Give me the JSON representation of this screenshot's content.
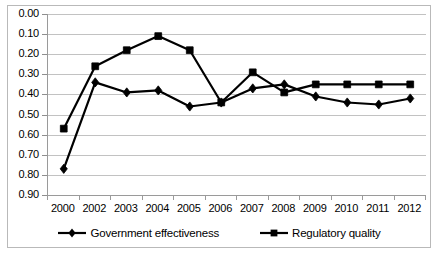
{
  "chart_data": {
    "type": "line",
    "title": "",
    "xlabel": "",
    "ylabel": "",
    "categories": [
      "2000",
      "2002",
      "2003",
      "2004",
      "2005",
      "2006",
      "2007",
      "2008",
      "2009",
      "2010",
      "2011",
      "2012"
    ],
    "ylim": [
      0.0,
      0.9
    ],
    "y_axis_inverted": true,
    "y_ticks": [
      "0.00",
      "0.10",
      "0.20",
      "0.30",
      "0.40",
      "0.50",
      "0.60",
      "0.70",
      "0.80",
      "0.90"
    ],
    "y_tick_values": [
      0.0,
      0.1,
      0.2,
      0.3,
      0.4,
      0.5,
      0.6,
      0.7,
      0.8,
      0.9
    ],
    "grid": true,
    "legend_position": "bottom",
    "series": [
      {
        "name": "Government effectiveness",
        "marker": "diamond",
        "color": "#000000",
        "values": [
          0.77,
          0.34,
          0.39,
          0.38,
          0.46,
          0.44,
          0.37,
          0.35,
          0.41,
          0.44,
          0.45,
          0.42
        ]
      },
      {
        "name": "Regulatory quality",
        "marker": "square",
        "color": "#000000",
        "values": [
          0.57,
          0.26,
          0.18,
          0.11,
          0.18,
          0.44,
          0.29,
          0.39,
          0.35,
          0.35,
          0.35,
          0.35
        ]
      }
    ]
  },
  "legend": {
    "items": [
      {
        "label": "Government effectiveness",
        "marker": "diamond"
      },
      {
        "label": "Regulatory quality",
        "marker": "square"
      }
    ]
  }
}
